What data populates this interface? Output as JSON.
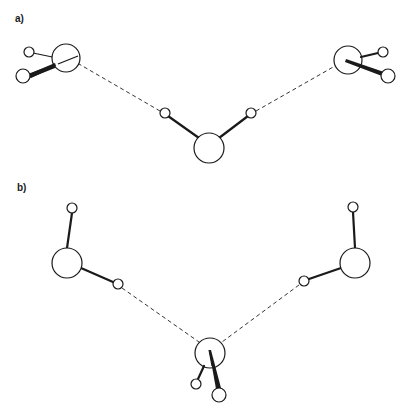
{
  "figure": {
    "panels": [
      {
        "label": "a)",
        "description": "Three water molecules: central donor molecule forming two hydrogen bonds (dashed) to two acceptor oxygen atoms",
        "molecules": [
          {
            "name": "left-acceptor",
            "oxygen": {
              "x": 66,
              "y": 58,
              "r": 14
            },
            "hydrogens": [
              {
                "x": 29,
                "y": 52,
                "r": 5
              },
              {
                "x": 23,
                "y": 76,
                "r": 7
              }
            ]
          },
          {
            "name": "central-donor",
            "oxygen": {
              "x": 209,
              "y": 148,
              "r": 15
            },
            "hydrogens": [
              {
                "x": 165,
                "y": 113,
                "r": 5
              },
              {
                "x": 251,
                "y": 113,
                "r": 5
              }
            ]
          },
          {
            "name": "right-acceptor",
            "oxygen": {
              "x": 348,
              "y": 60,
              "r": 14
            },
            "hydrogens": [
              {
                "x": 383,
                "y": 52,
                "r": 5
              },
              {
                "x": 388,
                "y": 76,
                "r": 7
              }
            ]
          }
        ],
        "hydrogen_bonds": [
          {
            "from": [
              165,
              113
            ],
            "to": [
              66,
              58
            ]
          },
          {
            "from": [
              251,
              113
            ],
            "to": [
              348,
              60
            ]
          }
        ]
      },
      {
        "label": "b)",
        "description": "Three water molecules: two donor molecules each forming a hydrogen bond (dashed) to a central acceptor oxygen",
        "molecules": [
          {
            "name": "left-donor",
            "oxygen": {
              "x": 67,
              "y": 263,
              "r": 15
            },
            "hydrogens": [
              {
                "x": 72,
                "y": 208,
                "r": 5
              },
              {
                "x": 118,
                "y": 284,
                "r": 5
              }
            ]
          },
          {
            "name": "central-acceptor",
            "oxygen": {
              "x": 210,
              "y": 353,
              "r": 15
            },
            "hydrogens": [
              {
                "x": 196,
                "y": 384,
                "r": 5
              },
              {
                "x": 219,
                "y": 395,
                "r": 7
              }
            ]
          },
          {
            "name": "right-donor",
            "oxygen": {
              "x": 355,
              "y": 263,
              "r": 15
            },
            "hydrogens": [
              {
                "x": 353,
                "y": 207,
                "r": 5
              },
              {
                "x": 304,
                "y": 281,
                "r": 5
              }
            ]
          }
        ],
        "hydrogen_bonds": [
          {
            "from": [
              118,
              284
            ],
            "to": [
              210,
              353
            ]
          },
          {
            "from": [
              304,
              281
            ],
            "to": [
              210,
              353
            ]
          }
        ]
      }
    ]
  }
}
